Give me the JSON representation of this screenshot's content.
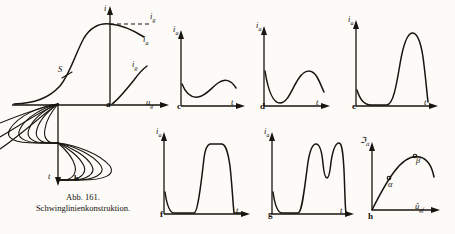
{
  "figure": {
    "caption_number": "Abb. 161.",
    "caption_title": "Schwinglinienkonstruktion.",
    "ink_color": "#18140f",
    "paper_color": "#fcfbf7"
  },
  "panels": {
    "a": {
      "key": "a",
      "label": "a",
      "y_axis_label": "i",
      "x_axis_label": "u",
      "x_axis_sub": "g",
      "curve_labels": [
        {
          "text": "i",
          "sub": "g",
          "role": "grid-current-asymptote"
        },
        {
          "text": "i",
          "sub": "a",
          "role": "anode-current-curve"
        },
        {
          "text": "i",
          "sub": "g",
          "role": "grid-current-curve"
        },
        {
          "text": "S",
          "sub": "",
          "role": "slope-steepness-marker"
        }
      ]
    },
    "b": {
      "key": "b",
      "label": "b",
      "y_axis_label": "t",
      "lobe_count": 5,
      "description": "Schwinglinienkonstruktion lobes"
    },
    "c": {
      "key": "c",
      "label": "c",
      "y_axis_label": "i",
      "y_axis_sub": "a",
      "x_axis_label": "t",
      "waveform": "shallow-sine"
    },
    "d": {
      "key": "d",
      "label": "d",
      "y_axis_label": "i",
      "y_axis_sub": "a",
      "x_axis_label": "t",
      "waveform": "deeper-sine"
    },
    "e": {
      "key": "e",
      "label": "e",
      "y_axis_label": "i",
      "y_axis_sub": "a",
      "x_axis_label": "t",
      "waveform": "single-narrow-pulse"
    },
    "f": {
      "key": "f",
      "label": "f",
      "y_axis_label": "i",
      "y_axis_sub": "a",
      "x_axis_label": "t",
      "waveform": "flat-top-pulse"
    },
    "g": {
      "key": "g",
      "label": "g",
      "y_axis_label": "i",
      "y_axis_sub": "a",
      "x_axis_label": "t",
      "waveform": "double-hump-pulse"
    },
    "h": {
      "key": "h",
      "label": "h",
      "y_axis_label": "ℑ",
      "y_axis_sub": "a",
      "x_axis_label": "û",
      "x_axis_sub": "gf",
      "curve_labels": [
        {
          "text": "α",
          "role": "lower-operating-point"
        },
        {
          "text": "β",
          "role": "upper-operating-point"
        }
      ]
    }
  }
}
